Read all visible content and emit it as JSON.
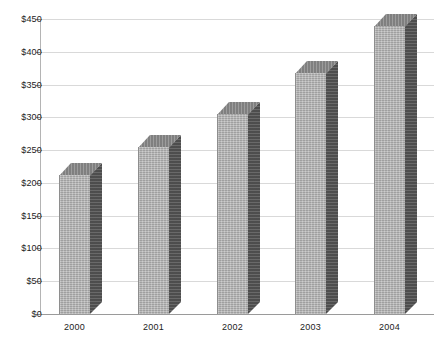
{
  "chart_data": {
    "type": "bar",
    "title": "",
    "subtitle": "",
    "xlabel": "",
    "ylabel": "",
    "categories": [
      "2000",
      "2001",
      "2002",
      "2003",
      "2004"
    ],
    "values": [
      212,
      254,
      305,
      368,
      440
    ],
    "ylim": [
      0,
      450
    ],
    "y_ticks": [
      0,
      50,
      100,
      150,
      200,
      250,
      300,
      350,
      400,
      450
    ],
    "y_tick_labels": [
      "$0",
      "$50",
      "$100",
      "$150",
      "$200",
      "$250",
      "$300",
      "$350",
      "$400",
      "$450"
    ],
    "value_prefix": "$",
    "grid": true,
    "grid_axis": "y",
    "legend": null,
    "legend_position": "none",
    "annotations": [],
    "style": {
      "three_d": true,
      "bar_front_color": "#b2b2b2",
      "bar_side_color": "#585858",
      "bar_top_color": "#8c8c8c",
      "gridline_color": "#d9d9d9",
      "axis_color": "#9a9a9a",
      "text_color": "#1c1c1c",
      "background_color": "#ffffff"
    }
  },
  "axes": {
    "y_axis_name": "y-axis",
    "x_axis_name": "x-axis"
  }
}
